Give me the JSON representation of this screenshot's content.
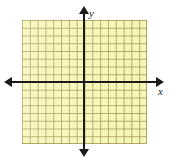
{
  "figure": {
    "title": "",
    "background_color": "#ffffff",
    "grid_fill_color": "#f7f5b4",
    "grid_line_color": "#786e28",
    "axis_color": "#1b1b1b"
  },
  "axes": {
    "x": {
      "label": "x",
      "label_icon": "x-axis-label",
      "arrow_left": "arrow-left-icon",
      "arrow_right": "arrow-right-icon"
    },
    "y": {
      "label": "y",
      "label_icon": "y-axis-label",
      "arrow_up": "arrow-up-icon",
      "arrow_down": "arrow-down-icon"
    }
  },
  "chart_data": {
    "type": "scatter",
    "title": "",
    "xlabel": "x",
    "ylabel": "y",
    "x": [],
    "y": [],
    "series": [],
    "xlim": [
      -8,
      8
    ],
    "ylim": [
      -8,
      8
    ],
    "xticks": [
      -8,
      -7,
      -6,
      -5,
      -4,
      -3,
      -2,
      -1,
      0,
      1,
      2,
      3,
      4,
      5,
      6,
      7,
      8
    ],
    "yticks": [
      -8,
      -7,
      -6,
      -5,
      -4,
      -3,
      -2,
      -1,
      0,
      1,
      2,
      3,
      4,
      5,
      6,
      7,
      8
    ],
    "xtick_labels": [],
    "ytick_labels": [],
    "grid": true,
    "grid_columns": 16,
    "grid_rows": 16,
    "legend": null,
    "legend_position": "none",
    "annotations": []
  }
}
